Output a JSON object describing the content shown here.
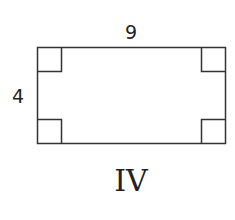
{
  "figure": {
    "shape": "rectangle",
    "width_label": "9",
    "height_label": "4",
    "caption": "IV",
    "right_angle_markers": 4,
    "stroke_color": "#333333"
  }
}
